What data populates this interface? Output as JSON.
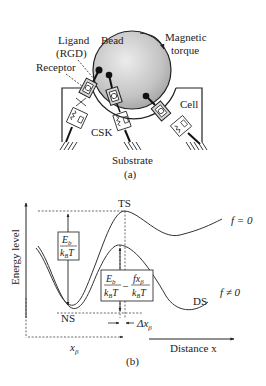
{
  "panel_a": {
    "caption": "(a)",
    "labels": {
      "ligand": "Ligand",
      "ligand_sub": "(RGD)",
      "bead": "Bead",
      "magnetic": "Magnetic",
      "torque": "torque",
      "receptor": "Receptor",
      "cell": "Cell",
      "csk": "CSK",
      "substrate": "Substrate"
    },
    "colors": {
      "bead_fill_center": "#e6e6e6",
      "bead_fill_edge": "#a8a8a8",
      "line": "#222222",
      "receptor_fill": "#d8d8d8"
    }
  },
  "panel_b": {
    "caption": "(b)",
    "y_axis_label": "Energy level",
    "x_axis_label": "Distance x",
    "states": {
      "transition": "TS",
      "native": "NS",
      "dissociated": "DS"
    },
    "curves": {
      "f_zero": "f = 0",
      "f_nonzero": "f ≠ 0"
    },
    "box1": {
      "num": "E",
      "num_sub": "b",
      "den": "k",
      "den_sub": "B",
      "den_tail": "T"
    },
    "box2": {
      "term1_num": "E",
      "term1_num_sub": "b",
      "term1_den": "k",
      "term1_den_sub": "B",
      "term1_den_tail": "T",
      "minus": "–",
      "term2_num": "fx",
      "term2_num_sub": "β",
      "term2_den": "k",
      "term2_den_sub": "B",
      "term2_den_tail": "T"
    },
    "delta_label": "Δx",
    "delta_sub": "β",
    "x_beta": "x",
    "x_beta_sub": "β"
  }
}
